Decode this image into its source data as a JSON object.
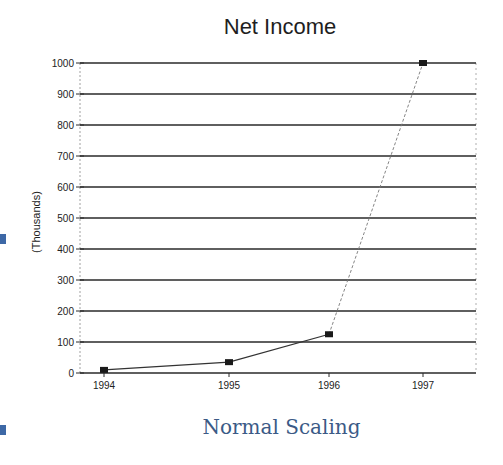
{
  "chart_data": {
    "type": "line",
    "title": "Net Income",
    "xlabel": "",
    "ylabel": "(Thousands)",
    "categories": [
      "1994",
      "1995",
      "1996",
      "1997"
    ],
    "series": [
      {
        "name": "Net Income",
        "values": [
          10,
          35,
          125,
          1000
        ]
      }
    ],
    "ylim": [
      0,
      1000
    ],
    "yticks": [
      0,
      100,
      200,
      300,
      400,
      500,
      600,
      700,
      800,
      900,
      1000
    ],
    "grid": true,
    "legend": "none",
    "caption": "Normal Scaling"
  },
  "caption": "Normal Scaling",
  "colors": {
    "line": "#333333",
    "marker": "#1a1a1a",
    "grid": "#2a2a2a",
    "caption": "#3b5a86",
    "accent_square": "#3d68a6"
  }
}
